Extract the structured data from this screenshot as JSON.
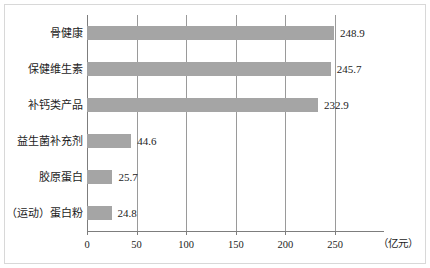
{
  "chart_data": {
    "type": "bar",
    "orientation": "horizontal",
    "title": "",
    "subtitle": "",
    "xlabel": "（亿元）",
    "ylabel": "",
    "categories": [
      "骨健康",
      "保健维生素",
      "补钙类产品",
      "益生菌补充剂",
      "胶原蛋白",
      "（运动）蛋白粉"
    ],
    "values": [
      248.9,
      245.7,
      232.9,
      44.6,
      25.7,
      24.8
    ],
    "value_labels": [
      "248.9",
      "245.7",
      "232.9",
      "44.6",
      "25.7",
      "24.8"
    ],
    "xlim": [
      0,
      250
    ],
    "xticks": [
      0,
      50,
      100,
      150,
      200,
      250
    ],
    "xtick_labels": [
      "0",
      "50",
      "100",
      "150",
      "200",
      "250"
    ],
    "grid": "vertical",
    "legend": null,
    "bar_color": "#a5a5a5",
    "axis_color": "#7d7d7d",
    "gridline_color": "#9a9a9a",
    "text_color": "#1c1c1c",
    "background": "#ffffff"
  }
}
